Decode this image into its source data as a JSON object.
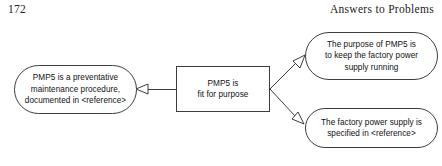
{
  "page": {
    "folio": "172",
    "running_head": "Answers to Problems",
    "width": 442,
    "height": 166,
    "background_color": "#ffffff",
    "line_color": "#3c3c3c",
    "text_color": "#101010"
  },
  "diagram": {
    "type": "argument-map",
    "nodes": {
      "claim": {
        "id": "claim",
        "shape": "rectangle",
        "text": "PMP5 is\nfit for purpose"
      },
      "evidence": {
        "id": "evidence",
        "shape": "stadium",
        "text": "PMP5 is a preventative\nmaintenance procedure,\ndocumented in <reference>"
      },
      "purpose": {
        "id": "purpose",
        "shape": "stadium",
        "text": "The purpose of PMP5 is\nto keep the factory power\nsupply running"
      },
      "specification": {
        "id": "specification",
        "shape": "stadium",
        "text": "The factory power supply is\nspecified in <reference>"
      }
    },
    "connectors": [
      {
        "id": "claim-to-evidence",
        "from": "claim",
        "to": "evidence",
        "arrowhead": "hollow-triangle",
        "direction": "left"
      },
      {
        "id": "claim-to-purpose",
        "from": "claim",
        "to": "purpose",
        "arrowhead": "hollow-triangle",
        "direction": "up-right"
      },
      {
        "id": "claim-to-specification",
        "from": "claim",
        "to": "specification",
        "arrowhead": "hollow-triangle",
        "direction": "down-right"
      }
    ]
  }
}
